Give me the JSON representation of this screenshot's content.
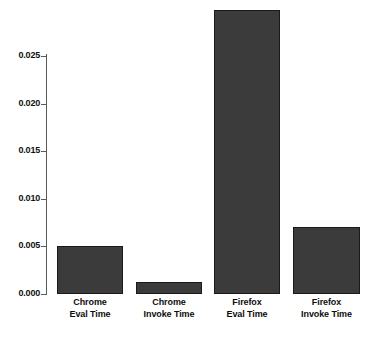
{
  "chart_data": {
    "type": "bar",
    "title": "",
    "subtitle": "",
    "xlabel": "",
    "ylabel": "",
    "categories": [
      "Chrome Eval Time",
      "Chrome Invoke Time",
      "Firefox Eval Time",
      "Firefox Invoke Time"
    ],
    "category_lines": [
      [
        "Chrome",
        "Eval Time"
      ],
      [
        "Chrome",
        "Invoke Time"
      ],
      [
        "Firefox",
        "Eval Time"
      ],
      [
        "Firefox",
        "Invoke Time"
      ]
    ],
    "values": [
      0.005,
      0.00125,
      0.0298,
      0.007
    ],
    "ylim": [
      0.0,
      0.025
    ],
    "ytick_labels": [
      "0.000",
      "0.005",
      "0.010",
      "0.015",
      "0.020",
      "0.025"
    ],
    "ytick_values": [
      0.0,
      0.005,
      0.01,
      0.015,
      0.02,
      0.025
    ],
    "grid": false,
    "legend": "none",
    "bar_color": "#3b3b3b",
    "bar_border_color": "#1a1a1a",
    "axis_color": "#5a5a5a",
    "background_color": "#ffffff",
    "text_color": "#0d0d0d",
    "note": "Firefox Eval Time bar extends above the topmost 0.025 tick and is clipped by the plot edge."
  },
  "ticks": {
    "t0": "0.000",
    "t1": "0.005",
    "t2": "0.010",
    "t3": "0.015",
    "t4": "0.020",
    "t5": "0.025"
  },
  "labels": {
    "b0l1": "Chrome",
    "b0l2": "Eval Time",
    "b1l1": "Chrome",
    "b1l2": "Invoke Time",
    "b2l1": "Firefox",
    "b2l2": "Eval Time",
    "b3l1": "Firefox",
    "b3l2": "Invoke Time"
  }
}
